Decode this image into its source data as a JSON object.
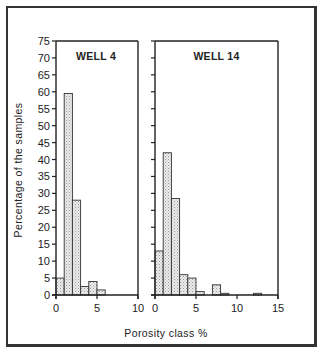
{
  "chart_data": [
    {
      "type": "bar",
      "title": "WELL 4",
      "xlabel": "Porosity class %",
      "ylabel": "Percentage of the samples",
      "bin_width": 1,
      "bins": [
        "0-1",
        "1-2",
        "2-3",
        "3-4",
        "4-5",
        "5-6"
      ],
      "values": [
        5,
        59.5,
        28,
        2.5,
        4,
        1.5
      ],
      "xlim": [
        0,
        10
      ],
      "xticks": [
        0,
        5,
        10
      ],
      "ylim": [
        0,
        75
      ],
      "yticks": [
        0,
        5,
        10,
        15,
        20,
        25,
        30,
        35,
        40,
        45,
        50,
        55,
        60,
        65,
        70,
        75
      ],
      "grid": false
    },
    {
      "type": "bar",
      "title": "WELL 14",
      "xlabel": "Porosity class %",
      "ylabel": "Percentage of the samples",
      "bin_width": 1,
      "bins": [
        "0-1",
        "1-2",
        "2-3",
        "3-4",
        "4-5",
        "5-6",
        "6-7",
        "7-8",
        "8-9",
        "9-10",
        "10-11",
        "11-12",
        "12-13"
      ],
      "values": [
        13,
        42,
        28.5,
        6,
        5,
        1,
        0,
        3,
        0.5,
        0,
        0,
        0,
        0.5
      ],
      "xlim": [
        0,
        15
      ],
      "xticks": [
        0,
        5,
        10,
        15
      ],
      "ylim": [
        0,
        75
      ],
      "yticks": [
        0,
        5,
        10,
        15,
        20,
        25,
        30,
        35,
        40,
        45,
        50,
        55,
        60,
        65,
        70,
        75
      ],
      "grid": false
    }
  ],
  "labels": {
    "ylabel": "Percentage of the samples",
    "xlabel": "Porosity class %",
    "panel1_title": "WELL 4",
    "panel2_title": "WELL 14"
  },
  "colors": {
    "bar_fill": "#e4e4e4",
    "bar_stroke": "#333333",
    "axis": "#222222"
  }
}
